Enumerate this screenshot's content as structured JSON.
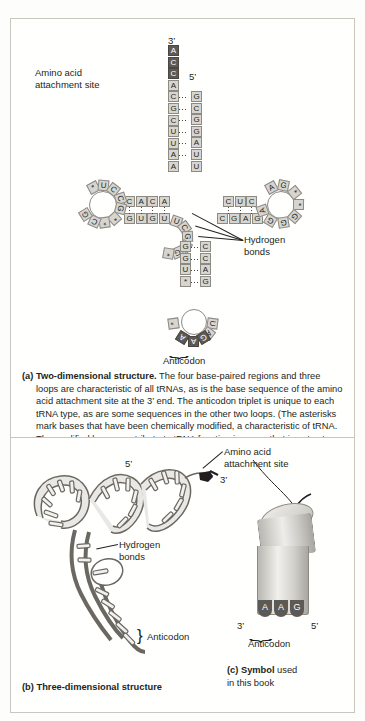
{
  "figure": {
    "panel_a": {
      "label_amino_acid": "Amino acid\nattachment site",
      "label_hydrogen": "Hydrogen\nbonds",
      "label_anticodon": "Anticodon",
      "prime_3": "3’",
      "prime_5": "5’",
      "acceptor_3_strand": [
        "A",
        "C",
        "C",
        "A",
        "C",
        "G",
        "C",
        "U",
        "U",
        "A",
        "A"
      ],
      "acceptor_5_strand": [
        "G",
        "C",
        "G",
        "G",
        "A",
        "U",
        "U"
      ],
      "acceptor_dark_count": 3,
      "d_stem_top": [
        "C",
        "A",
        "C",
        "A"
      ],
      "d_stem_bottom": [
        "G",
        "U",
        "G",
        "U"
      ],
      "d_loop": [
        "*",
        "U",
        "C",
        "C",
        "G",
        "*",
        "*",
        "C",
        "G"
      ],
      "t_stem_top": [
        "C",
        "U",
        "C"
      ],
      "t_stem_bottom": [
        "C",
        "G",
        "A",
        "G"
      ],
      "t_loop": [
        "A",
        "G",
        "*",
        "*",
        "G",
        "G",
        "G",
        "A"
      ],
      "ac_stem_left": [
        "G",
        "G",
        "U",
        "*"
      ],
      "ac_stem_right": [
        "C",
        "C",
        "A",
        "G"
      ],
      "ac_loop_left": [
        "*"
      ],
      "ac_loop_right": [
        "U",
        "A"
      ],
      "anticodon_bases": [
        "A",
        "A",
        "G"
      ],
      "variable_loop": [
        "U",
        "C",
        "G",
        "A",
        "G",
        "*"
      ],
      "caption": "(a) Two-dimensional structure. The four base-paired regions and three loops are characteristic of all tRNAs, as is the base sequence of the amino acid attachment site at the 3’ end. The anticodon triplet is unique to each tRNA type, as are some sequences in the other two loops. (The asterisks mark bases that have been chemically modified, a characteristic of tRNA. The modified bases contribute to tRNA function in a way that is not yet understood.)",
      "caption_bold": "(a) Two-dimensional structure.",
      "caption_rest": " The four base-paired regions and three loops are characteristic of all tRNAs, as is the base sequence of the amino acid attachment site at the 3’ end. The anticodon triplet is unique to each tRNA type, as are some sequences in the other two loops. (The asterisks mark bases that have been chemically modified, a characteristic of tRNA. The modified bases contribute to tRNA function in a way that is not yet understood.)"
    },
    "panel_b": {
      "label_hydrogen": "Hydrogen\nbonds",
      "label_anticodon": "Anticodon",
      "prime_5": "5’",
      "prime_3": "3’",
      "caption_bold": "(b) Three-dimensional structure"
    },
    "panel_c": {
      "label_amino_acid": "Amino acid\nattachment site",
      "label_anticodon": "Anticodon",
      "prime_3": "3’",
      "prime_5": "5’",
      "anticodon_bases": [
        "A",
        "A",
        "G"
      ],
      "caption_bold": "(c) Symbol",
      "caption_rest": " used\nin this book"
    }
  },
  "colors": {
    "base_fill": "#d7d5d0",
    "base_dark": "#5d5a55",
    "outline": "#8d8a84",
    "text": "#231f20",
    "panel_border": "#c9c6c0",
    "background": "#fdfdfc"
  }
}
